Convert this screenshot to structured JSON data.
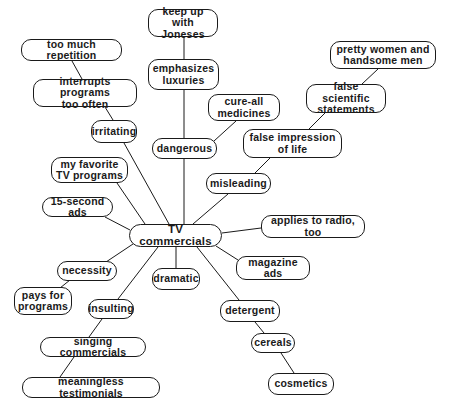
{
  "diagram": {
    "type": "concept-map",
    "colors": {
      "line": "#1a1a1a",
      "node_border": "#1a1a1a",
      "text": "#1a1a1a",
      "background": "#ffffff"
    },
    "center": {
      "id": "tv",
      "label": "TV commercials"
    },
    "nodes": [
      {
        "id": "tv",
        "label": "TV commercials",
        "x": 129,
        "y": 224,
        "w": 93,
        "h": 23
      },
      {
        "id": "joneses",
        "label": "keep up\nwith Joneses",
        "x": 148,
        "y": 9,
        "w": 70,
        "h": 28
      },
      {
        "id": "luxuries",
        "label": "emphasizes\nluxuries",
        "x": 148,
        "y": 59,
        "w": 71,
        "h": 31
      },
      {
        "id": "repetition",
        "label": "too much repetition",
        "x": 21,
        "y": 39,
        "w": 101,
        "h": 22
      },
      {
        "id": "interrupts",
        "label": "interrupts programs\ntoo often",
        "x": 33,
        "y": 79,
        "w": 104,
        "h": 28
      },
      {
        "id": "irritating",
        "label": "irritating",
        "x": 91,
        "y": 120,
        "w": 46,
        "h": 23
      },
      {
        "id": "cureall",
        "label": "cure-all\nmedicines",
        "x": 208,
        "y": 94,
        "w": 72,
        "h": 27
      },
      {
        "id": "pretty",
        "label": "pretty women and\nhandsome men",
        "x": 330,
        "y": 41,
        "w": 106,
        "h": 28
      },
      {
        "id": "scientific",
        "label": "false scientific\nstatements",
        "x": 306,
        "y": 84,
        "w": 80,
        "h": 29
      },
      {
        "id": "impression",
        "label": "false impression\nof life",
        "x": 243,
        "y": 129,
        "w": 99,
        "h": 29
      },
      {
        "id": "dangerous",
        "label": "dangerous",
        "x": 152,
        "y": 138,
        "w": 65,
        "h": 21
      },
      {
        "id": "favorite",
        "label": "my favorite\nTV programs",
        "x": 51,
        "y": 157,
        "w": 77,
        "h": 26
      },
      {
        "id": "misleading",
        "label": "misleading",
        "x": 206,
        "y": 173,
        "w": 65,
        "h": 21
      },
      {
        "id": "fifteen",
        "label": "15-second ads",
        "x": 42,
        "y": 197,
        "w": 71,
        "h": 20
      },
      {
        "id": "radio",
        "label": "applies to radio, too",
        "x": 261,
        "y": 215,
        "w": 104,
        "h": 23
      },
      {
        "id": "necessity",
        "label": "necessity",
        "x": 57,
        "y": 261,
        "w": 60,
        "h": 20
      },
      {
        "id": "magazine",
        "label": "magazine ads",
        "x": 236,
        "y": 256,
        "w": 74,
        "h": 24
      },
      {
        "id": "dramatic",
        "label": "dramatic",
        "x": 152,
        "y": 268,
        "w": 48,
        "h": 22
      },
      {
        "id": "pays",
        "label": "pays for\nprograms",
        "x": 14,
        "y": 287,
        "w": 58,
        "h": 28
      },
      {
        "id": "insulting",
        "label": "insulting",
        "x": 88,
        "y": 299,
        "w": 46,
        "h": 20
      },
      {
        "id": "detergent",
        "label": "detergent",
        "x": 220,
        "y": 300,
        "w": 60,
        "h": 22
      },
      {
        "id": "singing",
        "label": "singing commercials",
        "x": 40,
        "y": 337,
        "w": 106,
        "h": 20
      },
      {
        "id": "cereals",
        "label": "cereals",
        "x": 251,
        "y": 333,
        "w": 44,
        "h": 20
      },
      {
        "id": "testimonials",
        "label": "meaningless testimonials",
        "x": 22,
        "y": 377,
        "w": 138,
        "h": 21
      },
      {
        "id": "cosmetics",
        "label": "cosmetics",
        "x": 268,
        "y": 373,
        "w": 66,
        "h": 22
      }
    ],
    "edges": [
      {
        "from": "joneses",
        "to": "luxuries",
        "x1": 184,
        "y1": 37,
        "x2": 184,
        "y2": 59
      },
      {
        "from": "luxuries",
        "to": "dangerous",
        "x1": 184,
        "y1": 90,
        "x2": 184,
        "y2": 138
      },
      {
        "from": "repetition",
        "to": "interrupts",
        "x1": 72,
        "y1": 61,
        "x2": 82,
        "y2": 79
      },
      {
        "from": "interrupts",
        "to": "irritating",
        "x1": 105,
        "y1": 107,
        "x2": 113,
        "y2": 120
      },
      {
        "from": "irritating",
        "to": "tv",
        "x1": 124,
        "y1": 143,
        "x2": 169,
        "y2": 224
      },
      {
        "from": "cureall",
        "to": "dangerous",
        "x1": 236,
        "y1": 121,
        "x2": 214,
        "y2": 141
      },
      {
        "from": "pretty",
        "to": "scientific",
        "x1": 378,
        "y1": 69,
        "x2": 362,
        "y2": 84
      },
      {
        "from": "scientific",
        "to": "impression",
        "x1": 325,
        "y1": 113,
        "x2": 309,
        "y2": 129
      },
      {
        "from": "impression",
        "to": "misleading",
        "x1": 270,
        "y1": 158,
        "x2": 255,
        "y2": 173
      },
      {
        "from": "dangerous",
        "to": "tv",
        "x1": 184,
        "y1": 159,
        "x2": 184,
        "y2": 224
      },
      {
        "from": "favorite",
        "to": "tv",
        "x1": 117,
        "y1": 183,
        "x2": 145,
        "y2": 224
      },
      {
        "from": "misleading",
        "to": "tv",
        "x1": 228,
        "y1": 194,
        "x2": 193,
        "y2": 224
      },
      {
        "from": "fifteen",
        "to": "tv",
        "x1": 105,
        "y1": 217,
        "x2": 130,
        "y2": 230
      },
      {
        "from": "tv",
        "to": "radio",
        "x1": 222,
        "y1": 233,
        "x2": 261,
        "y2": 228
      },
      {
        "from": "tv",
        "to": "necessity",
        "x1": 133,
        "y1": 244,
        "x2": 106,
        "y2": 262
      },
      {
        "from": "tv",
        "to": "magazine",
        "x1": 216,
        "y1": 246,
        "x2": 238,
        "y2": 260
      },
      {
        "from": "tv",
        "to": "dramatic",
        "x1": 176,
        "y1": 247,
        "x2": 176,
        "y2": 268
      },
      {
        "from": "necessity",
        "to": "pays",
        "x1": 70,
        "y1": 280,
        "x2": 60,
        "y2": 288
      },
      {
        "from": "tv",
        "to": "insulting",
        "x1": 158,
        "y1": 247,
        "x2": 118,
        "y2": 299
      },
      {
        "from": "tv",
        "to": "detergent",
        "x1": 197,
        "y1": 247,
        "x2": 239,
        "y2": 300
      },
      {
        "from": "insulting",
        "to": "singing",
        "x1": 102,
        "y1": 319,
        "x2": 89,
        "y2": 337
      },
      {
        "from": "detergent",
        "to": "cereals",
        "x1": 255,
        "y1": 322,
        "x2": 264,
        "y2": 333
      },
      {
        "from": "singing",
        "to": "testimonials",
        "x1": 74,
        "y1": 357,
        "x2": 60,
        "y2": 377
      },
      {
        "from": "cereals",
        "to": "cosmetics",
        "x1": 281,
        "y1": 353,
        "x2": 294,
        "y2": 373
      }
    ]
  }
}
